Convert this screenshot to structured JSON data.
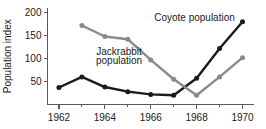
{
  "chart_data": {
    "type": "line",
    "title": "",
    "xlabel": "",
    "ylabel": "Population index",
    "x": [
      1962,
      1963,
      1964,
      1965,
      1966,
      1967,
      1968,
      1969,
      1970
    ],
    "xlim": [
      1961.5,
      1970.5
    ],
    "ylim": [
      0,
      210
    ],
    "xticks": [
      1962,
      1964,
      1966,
      1968,
      1970
    ],
    "xticklabels": [
      "1962",
      "1964",
      "1966",
      "1968",
      "1970"
    ],
    "xminorticks": [
      1963,
      1965,
      1967,
      1969
    ],
    "yticks": [
      50,
      100,
      150,
      200
    ],
    "yticklabels": [
      "50",
      "100",
      "150",
      "200"
    ],
    "grid": false,
    "legend_position": "inline-annotations",
    "series": [
      {
        "name": "Jackrabbit population",
        "color": "#1a1a1a",
        "x": [
          1962,
          1963,
          1964,
          1965,
          1966,
          1967,
          1968,
          1969,
          1970
        ],
        "values": [
          37,
          60,
          38,
          28,
          22,
          20,
          57,
          122,
          180
        ]
      },
      {
        "name": "Coyote population",
        "color": "#8a8a8a",
        "x": [
          1963,
          1964,
          1965,
          1966,
          1967,
          1968,
          1969,
          1970
        ],
        "values": [
          172,
          148,
          142,
          97,
          55,
          20,
          60,
          102
        ]
      }
    ],
    "annotations": [
      {
        "text": "Coyote population",
        "x": 1966.15,
        "y": 182,
        "series": "Coyote population"
      },
      {
        "text": "Jackrabbit",
        "x": 1964.62,
        "y": 108,
        "series": "Jackrabbit population"
      },
      {
        "text": "population",
        "x": 1964.62,
        "y": 88,
        "series": "Jackrabbit population"
      }
    ]
  }
}
